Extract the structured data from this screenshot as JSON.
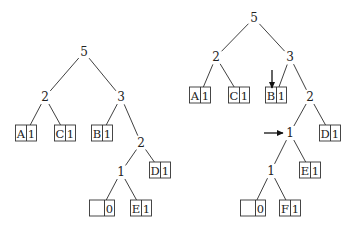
{
  "diagram": {
    "type": "huffman-tree-comparison",
    "trees": [
      {
        "id": "left",
        "nodes": [
          {
            "id": "L5",
            "label": "5",
            "x": 84,
            "y": 52
          },
          {
            "id": "L2a",
            "label": "2",
            "x": 45,
            "y": 97
          },
          {
            "id": "L3",
            "label": "3",
            "x": 121,
            "y": 97
          },
          {
            "id": "L2b",
            "label": "2",
            "x": 141,
            "y": 143
          },
          {
            "id": "L1",
            "label": "1",
            "x": 121,
            "y": 172
          }
        ],
        "leaves": [
          {
            "id": "LA",
            "symbol": "A",
            "weight": "1",
            "x": 26,
            "y": 133
          },
          {
            "id": "LC",
            "symbol": "C",
            "weight": "1",
            "x": 65,
            "y": 133
          },
          {
            "id": "LB",
            "symbol": "B",
            "weight": "1",
            "x": 102,
            "y": 133
          },
          {
            "id": "LD",
            "symbol": "D",
            "weight": "1",
            "x": 160,
            "y": 170
          },
          {
            "id": "LN",
            "symbol": "",
            "weight": "0",
            "x": 102,
            "y": 208
          },
          {
            "id": "LE",
            "symbol": "E",
            "weight": "1",
            "x": 141,
            "y": 208
          }
        ],
        "edges": [
          [
            "L5",
            "L2a"
          ],
          [
            "L5",
            "L3"
          ],
          [
            "L2a",
            "LA"
          ],
          [
            "L2a",
            "LC"
          ],
          [
            "L3",
            "LB"
          ],
          [
            "L3",
            "L2b"
          ],
          [
            "L2b",
            "L1"
          ],
          [
            "L2b",
            "LD"
          ],
          [
            "L1",
            "LN"
          ],
          [
            "L1",
            "LE"
          ]
        ]
      },
      {
        "id": "right",
        "nodes": [
          {
            "id": "R5",
            "label": "5",
            "x": 254,
            "y": 18
          },
          {
            "id": "R2a",
            "label": "2",
            "x": 216,
            "y": 57
          },
          {
            "id": "R3",
            "label": "3",
            "x": 290,
            "y": 57
          },
          {
            "id": "R2b",
            "label": "2",
            "x": 310,
            "y": 97
          },
          {
            "id": "R1a",
            "label": "1",
            "x": 290,
            "y": 133
          },
          {
            "id": "R1b",
            "label": "1",
            "x": 271,
            "y": 171
          }
        ],
        "leaves": [
          {
            "id": "RA",
            "symbol": "A",
            "weight": "1",
            "x": 200,
            "y": 95
          },
          {
            "id": "RC",
            "symbol": "C",
            "weight": "1",
            "x": 239,
            "y": 95
          },
          {
            "id": "RB",
            "symbol": "B",
            "weight": "1",
            "x": 276,
            "y": 95
          },
          {
            "id": "RD",
            "symbol": "D",
            "weight": "1",
            "x": 330,
            "y": 133
          },
          {
            "id": "RE",
            "symbol": "E",
            "weight": "1",
            "x": 310,
            "y": 170
          },
          {
            "id": "RN",
            "symbol": "",
            "weight": "0",
            "x": 253,
            "y": 208
          },
          {
            "id": "RF",
            "symbol": "F",
            "weight": "1",
            "x": 290,
            "y": 208
          }
        ],
        "edges": [
          [
            "R5",
            "R2a"
          ],
          [
            "R5",
            "R3"
          ],
          [
            "R2a",
            "RA"
          ],
          [
            "R2a",
            "RC"
          ],
          [
            "R3",
            "RB"
          ],
          [
            "R3",
            "R2b"
          ],
          [
            "R2b",
            "R1a"
          ],
          [
            "R2b",
            "RD"
          ],
          [
            "R1a",
            "R1b"
          ],
          [
            "R1a",
            "RE"
          ],
          [
            "R1b",
            "RN"
          ],
          [
            "R1b",
            "RF"
          ]
        ]
      }
    ],
    "arrows": [
      {
        "id": "arrow-down-to-B",
        "direction": "down",
        "x1": 272,
        "y1": 70,
        "x2": 272,
        "y2": 88
      },
      {
        "id": "arrow-right-to-1",
        "direction": "right",
        "x1": 264,
        "y1": 133,
        "x2": 283,
        "y2": 133
      }
    ]
  }
}
